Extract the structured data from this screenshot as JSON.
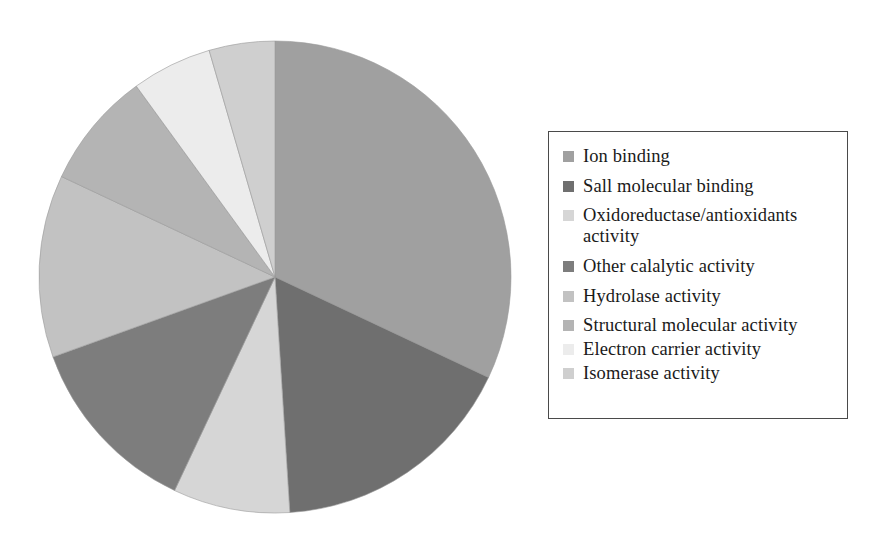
{
  "chart_data": {
    "type": "pie",
    "title": "",
    "subtitle": "",
    "xlabel": "",
    "ylabel": "",
    "grid": false,
    "legend_position": "right",
    "start_angle_deg": 0,
    "direction": "clockwise",
    "categories": [
      "Ion binding",
      "Sall molecular binding",
      "Oxidoreductase/antioxidants activity",
      "Other calalytic activity",
      "Hydrolase activity",
      "Structural molecular activity",
      "Electron carrier activity",
      "Isomerase activity"
    ],
    "values": [
      32.0,
      17.0,
      8.0,
      12.5,
      12.5,
      8.0,
      5.5,
      4.5
    ],
    "value_unit": "percent",
    "angles_deg": [
      115.2,
      61.2,
      28.8,
      45.0,
      45.0,
      28.8,
      19.8,
      16.2
    ],
    "colors": [
      "#a0a0a0",
      "#6f6f6f",
      "#d6d6d6",
      "#7d7d7d",
      "#c2c2c2",
      "#b4b4b4",
      "#ececec",
      "#cfcfcf"
    ]
  },
  "legend": {
    "items": [
      {
        "label": "Ion binding",
        "label_line2": "",
        "color": "#a0a0a0",
        "swatch": "legend-swatch"
      },
      {
        "label": "Sall molecular binding",
        "label_line2": "",
        "color": "#6f6f6f",
        "swatch": "legend-swatch"
      },
      {
        "label": "Oxidoreductase/antioxidants",
        "label_line2": "activity",
        "color": "#d6d6d6",
        "swatch": "legend-swatch"
      },
      {
        "label": "Other calalytic activity",
        "label_line2": "",
        "color": "#7d7d7d",
        "swatch": "legend-swatch"
      },
      {
        "label": "Hydrolase activity",
        "label_line2": "",
        "color": "#c2c2c2",
        "swatch": "legend-swatch"
      },
      {
        "label": "Structural molecular activity",
        "label_line2": "",
        "color": "#b4b4b4",
        "swatch": "legend-swatch"
      },
      {
        "label": "Electron carrier activity",
        "label_line2": "",
        "color": "#ececec",
        "swatch": "legend-swatch"
      },
      {
        "label": "Isomerase activity",
        "label_line2": "",
        "color": "#cfcfcf",
        "swatch": "legend-swatch"
      }
    ],
    "border_color": "#4a4a4a"
  },
  "figure": {
    "background": "#ffffff",
    "pie_center_x": 238,
    "pie_center_y": 238,
    "pie_radius": 236,
    "slice_edge_color": "#9a9a9a"
  }
}
